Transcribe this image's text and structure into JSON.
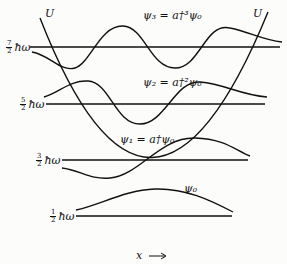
{
  "diagram": {
    "potential_label": "U",
    "x_axis_label": "x ⟶",
    "levels": [
      {
        "num": "7",
        "den": "2",
        "unit": "ħω",
        "psi_label": "ψ₃ = a†³ψ₀"
      },
      {
        "num": "5",
        "den": "2",
        "unit": "ħω",
        "psi_label": "ψ₂ = a†²ψ₀"
      },
      {
        "num": "3",
        "den": "2",
        "unit": "ħω",
        "psi_label": "ψ₁ = a†ψ₀"
      },
      {
        "num": "1",
        "den": "2",
        "unit": "ħω",
        "psi_label": "ψ₀"
      }
    ]
  }
}
